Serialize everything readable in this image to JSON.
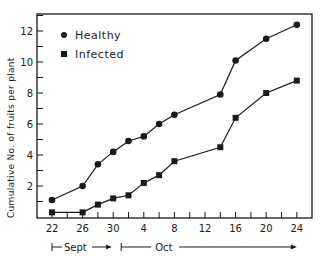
{
  "chart_data": {
    "type": "line",
    "title": "",
    "xlabel": "",
    "ylabel": "Cumulative No. of fruits per plant",
    "x_tick_labels": [
      "22",
      "26",
      "30",
      "4",
      "8",
      "12",
      "16",
      "20",
      "24"
    ],
    "x_tick_days": [
      0,
      4,
      8,
      12,
      16,
      20,
      24,
      28,
      32
    ],
    "y_tick_labels": [
      "2",
      "4",
      "6",
      "8",
      "10",
      "12"
    ],
    "ylim": [
      0,
      13
    ],
    "xlim_days": [
      -2,
      34
    ],
    "grid": false,
    "legend_position": "top-left (inside)",
    "periods": [
      {
        "label": "Sept",
        "start_day": 0,
        "end_day": 8
      },
      {
        "label": "Oct",
        "start_day": 9,
        "end_day": 32
      }
    ],
    "x_dates": [
      "Sep 22",
      "Sep 26",
      "Sep 28",
      "Sep 30",
      "Oct 2",
      "Oct 4",
      "Oct 6",
      "Oct 8",
      "Oct 14",
      "Oct 16",
      "Oct 20",
      "Oct 24"
    ],
    "x_days": [
      0,
      4,
      6,
      8,
      10,
      12,
      14,
      16,
      22,
      24,
      28,
      32
    ],
    "series": [
      {
        "name": "Healthy",
        "marker": "circle",
        "values": [
          1.1,
          2.0,
          3.4,
          4.2,
          4.9,
          5.2,
          6.0,
          6.6,
          7.9,
          10.1,
          11.5,
          12.4
        ]
      },
      {
        "name": "Infected",
        "marker": "square",
        "values": [
          0.3,
          0.3,
          0.8,
          1.2,
          1.4,
          2.2,
          2.7,
          3.6,
          4.5,
          6.4,
          8.0,
          8.8
        ]
      }
    ]
  },
  "legend": {
    "healthy": "Healthy",
    "infected": "Infected"
  },
  "axis": {
    "ylabel": "Cumulative No. of fruits per plant",
    "sept": "Sept",
    "oct": "Oct"
  }
}
